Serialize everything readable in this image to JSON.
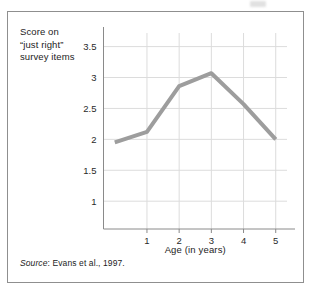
{
  "figure": {
    "border_color": "#8f8f8f",
    "background": "#ffffff"
  },
  "y_caption": {
    "line1": "Score on",
    "line2": "“just right”",
    "line3": "survey items"
  },
  "source": {
    "label": "Source",
    "separator": ":",
    "text": " Evans et al., 1997."
  },
  "chart_data": {
    "type": "line",
    "title": "",
    "xlabel": "Age (in years)",
    "ylabel": "Score on “just right” survey items",
    "x": [
      0,
      1,
      2,
      3,
      4,
      5
    ],
    "values": [
      1.95,
      2.12,
      2.86,
      3.07,
      2.57,
      2.0
    ],
    "xtick_labels": [
      "1",
      "2",
      "3",
      "4",
      "5"
    ],
    "xticks": [
      1,
      2,
      3,
      4,
      5
    ],
    "ytick_labels": [
      "3.5",
      "3",
      "2.5",
      "2",
      "1.5",
      "1"
    ],
    "yticks": [
      3.5,
      3,
      2.5,
      2,
      1.5,
      1
    ],
    "xlim": [
      -0.35,
      5.35
    ],
    "ylim": [
      0.55,
      3.72
    ],
    "grid": true,
    "grid_color": "#dcdcdc",
    "line_color": "#9d9d9d",
    "line_width": 4,
    "legend": "none",
    "markers": "none"
  }
}
